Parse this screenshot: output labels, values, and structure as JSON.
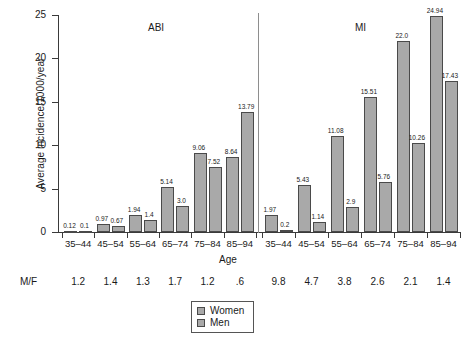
{
  "chart_data": {
    "type": "bar",
    "title": "",
    "xlabel": "Age",
    "ylabel": "Average incidence/1000/year",
    "ylim": [
      0,
      25
    ],
    "yticks": [
      0,
      5,
      10,
      15,
      20,
      25
    ],
    "grid": false,
    "legend_position": "bottom-center",
    "panels": [
      {
        "name": "ABI",
        "categories": [
          "35–44",
          "45–54",
          "55–64",
          "65–74",
          "75–84",
          "85–94"
        ],
        "series": [
          {
            "name": "Women",
            "values": [
              0.12,
              0.97,
              1.94,
              5.14,
              9.06,
              8.64
            ],
            "labels": [
              "0.12",
              "0.97",
              "1.94",
              "5.14",
              "9.06",
              "8.64"
            ]
          },
          {
            "name": "Men",
            "values": [
              0.1,
              0.67,
              1.4,
              3.0,
              7.52,
              13.79
            ],
            "labels": [
              "0.1",
              "0.67",
              "1.4",
              "3.0",
              "7.52",
              "13.79"
            ]
          }
        ],
        "mf_ratios": [
          "1.2",
          "1.4",
          "1.3",
          "1.7",
          "1.2",
          ".6"
        ]
      },
      {
        "name": "MI",
        "categories": [
          "35–44",
          "45–54",
          "55–64",
          "65–74",
          "75–84",
          "85–94"
        ],
        "series": [
          {
            "name": "Women",
            "values": [
              1.97,
              5.43,
              11.08,
              15.51,
              22.0,
              24.94
            ],
            "labels": [
              "1.97",
              "5.43",
              "11.08",
              "15.51",
              "22.0",
              "24.94"
            ]
          },
          {
            "name": "Men",
            "values": [
              0.2,
              1.14,
              2.9,
              5.76,
              10.26,
              17.43
            ],
            "labels": [
              "0.2",
              "1.14",
              "2.9",
              "5.76",
              "10.26",
              "17.43"
            ]
          }
        ],
        "mf_ratios": [
          "9.8",
          "4.7",
          "3.8",
          "2.6",
          "2.1",
          "1.4"
        ]
      }
    ],
    "mf_row_label": "M/F",
    "legend": [
      {
        "label": "Women",
        "color": "#a9a9a9"
      },
      {
        "label": "Men",
        "color": "#a9a9a9"
      }
    ],
    "colors": {
      "bar_fill": "#a9a9a9",
      "bar_stroke": "#4a4a4a",
      "axis": "#3a3a3a"
    }
  }
}
